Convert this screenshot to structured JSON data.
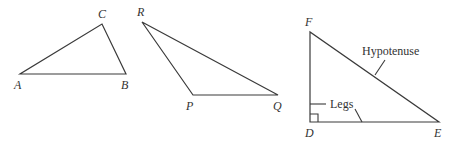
{
  "diagram": {
    "colors": {
      "line": "#3a3a3a",
      "text": "#333333",
      "background": "#ffffff"
    },
    "triangles": [
      {
        "id": "ABC",
        "kind": "acute",
        "vertices": [
          {
            "label": "A",
            "x": 20,
            "y": 74
          },
          {
            "label": "B",
            "x": 126,
            "y": 74
          },
          {
            "label": "C",
            "x": 102,
            "y": 24
          }
        ]
      },
      {
        "id": "PQR",
        "kind": "obtuse",
        "vertices": [
          {
            "label": "P",
            "x": 193,
            "y": 95
          },
          {
            "label": "Q",
            "x": 278,
            "y": 95
          },
          {
            "label": "R",
            "x": 142,
            "y": 22
          }
        ]
      },
      {
        "id": "DEF",
        "kind": "right",
        "vertices": [
          {
            "label": "D",
            "x": 310,
            "y": 122
          },
          {
            "label": "E",
            "x": 439,
            "y": 122
          },
          {
            "label": "F",
            "x": 310,
            "y": 32
          }
        ],
        "right_angle_at": "D",
        "annotations": {
          "hypotenuse": "Hypotenuse",
          "legs": "Legs"
        }
      }
    ],
    "labels": {
      "A": "A",
      "B": "B",
      "C": "C",
      "P": "P",
      "Q": "Q",
      "R": "R",
      "D": "D",
      "E": "E",
      "F": "F",
      "hypotenuse": "Hypotenuse",
      "legs": "Legs"
    }
  }
}
